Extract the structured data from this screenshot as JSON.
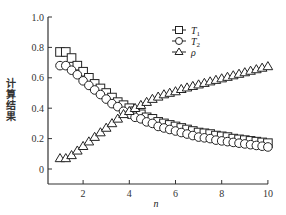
{
  "chart_data": {
    "type": "scatter",
    "title": "",
    "xlabel": "n",
    "ylabel": "计算结果",
    "xlim": [
      0.5,
      10
    ],
    "ylim": [
      -0.1,
      1.0
    ],
    "xticks": [
      2,
      4,
      6,
      8,
      10
    ],
    "yticks": [
      0,
      0.2,
      0.4,
      0.6,
      0.8,
      1.0
    ],
    "ytick_labels": [
      "0",
      "0.2",
      "0.4",
      "0.6",
      "0.8",
      "1.0"
    ],
    "grid": false,
    "legend_position": "upper center-right",
    "x": [
      1.0,
      1.25,
      1.5,
      1.75,
      2.0,
      2.25,
      2.5,
      2.75,
      3.0,
      3.25,
      3.5,
      3.75,
      4.0,
      4.25,
      4.5,
      4.75,
      5.0,
      5.25,
      5.5,
      5.75,
      6.0,
      6.25,
      6.5,
      6.75,
      7.0,
      7.25,
      7.5,
      7.75,
      8.0,
      8.25,
      8.5,
      8.75,
      9.0,
      9.25,
      9.5,
      9.75,
      10.0
    ],
    "series": [
      {
        "name": "T1",
        "label_main": "T",
        "label_sub": "1",
        "marker": "square",
        "values": [
          0.77,
          0.77,
          0.73,
          0.68,
          0.64,
          0.6,
          0.56,
          0.53,
          0.5,
          0.47,
          0.44,
          0.42,
          0.4,
          0.38,
          0.36,
          0.34,
          0.33,
          0.31,
          0.3,
          0.29,
          0.28,
          0.27,
          0.26,
          0.25,
          0.24,
          0.235,
          0.23,
          0.22,
          0.215,
          0.21,
          0.2,
          0.195,
          0.19,
          0.185,
          0.18,
          0.175,
          0.17
        ]
      },
      {
        "name": "T2",
        "label_main": "T",
        "label_sub": "2",
        "marker": "circle",
        "values": [
          0.68,
          0.68,
          0.65,
          0.62,
          0.58,
          0.55,
          0.52,
          0.49,
          0.46,
          0.43,
          0.41,
          0.38,
          0.36,
          0.34,
          0.33,
          0.31,
          0.3,
          0.28,
          0.27,
          0.26,
          0.25,
          0.24,
          0.23,
          0.22,
          0.21,
          0.205,
          0.2,
          0.19,
          0.185,
          0.18,
          0.175,
          0.17,
          0.165,
          0.16,
          0.155,
          0.15,
          0.145
        ]
      },
      {
        "name": "rho",
        "label_main": "ρ",
        "label_sub": "",
        "marker": "triangle",
        "values": [
          0.07,
          0.07,
          0.09,
          0.12,
          0.15,
          0.18,
          0.21,
          0.24,
          0.27,
          0.3,
          0.33,
          0.36,
          0.38,
          0.4,
          0.42,
          0.44,
          0.46,
          0.475,
          0.49,
          0.5,
          0.51,
          0.525,
          0.535,
          0.545,
          0.555,
          0.565,
          0.575,
          0.585,
          0.595,
          0.605,
          0.615,
          0.625,
          0.635,
          0.645,
          0.655,
          0.665,
          0.675
        ]
      }
    ]
  }
}
